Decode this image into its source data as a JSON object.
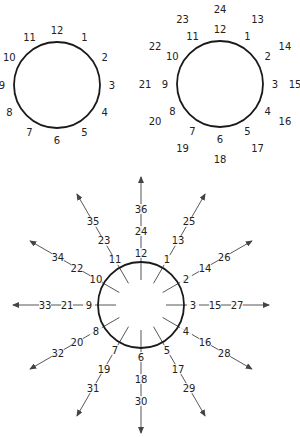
{
  "diagrams": [
    {
      "name": "clock-12",
      "center": [
        57,
        85
      ],
      "radius": 43,
      "rings": [
        {
          "radius": 55,
          "labels": [
            "12",
            "1",
            "2",
            "3",
            "4",
            "5",
            "6",
            "7",
            "8",
            "9",
            "10",
            "11"
          ]
        }
      ]
    },
    {
      "name": "clock-24",
      "center": [
        220,
        84
      ],
      "radius": 43,
      "rings": [
        {
          "radius": 55,
          "labels": [
            "12",
            "1",
            "2",
            "3",
            "4",
            "5",
            "6",
            "7",
            "8",
            "9",
            "10",
            "11"
          ]
        },
        {
          "radius": 75,
          "labels": [
            "24",
            "13",
            "14",
            "15",
            "16",
            "17",
            "18",
            "19",
            "20",
            "21",
            "22",
            "23"
          ]
        }
      ]
    },
    {
      "name": "clock-36-rays",
      "center": [
        141,
        305
      ],
      "radius": 43,
      "ray_inner": 25,
      "ray_outer": 128,
      "arrow_color": "#444444",
      "rings": [
        {
          "radius": 52,
          "labels": [
            "12",
            "1",
            "2",
            "3",
            "4",
            "5",
            "6",
            "7",
            "8",
            "9",
            "10",
            "11"
          ]
        },
        {
          "radius": 74,
          "labels": [
            "24",
            "13",
            "14",
            "15",
            "16",
            "17",
            "18",
            "19",
            "20",
            "21",
            "22",
            "23"
          ]
        },
        {
          "radius": 96,
          "labels": [
            "36",
            "25",
            "26",
            "27",
            "28",
            "29",
            "30",
            "31",
            "32",
            "33",
            "34",
            "35"
          ]
        }
      ]
    }
  ]
}
